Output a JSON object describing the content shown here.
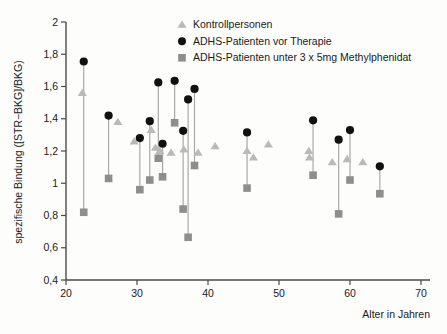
{
  "chart_data": {
    "type": "scatter",
    "title": "",
    "xlabel": "Alter in Jahren",
    "ylabel": "spezifische Bindung ([STR−BKG]/BKG)",
    "xlim": [
      20,
      70
    ],
    "ylim": [
      0.4,
      2.0
    ],
    "xticks": [
      20,
      30,
      40,
      50,
      60,
      70
    ],
    "xticklabels": [
      "20",
      "30",
      "40",
      "50",
      "60",
      "70"
    ],
    "yticks": [
      0.4,
      0.6,
      0.8,
      1.0,
      1.2,
      1.4,
      1.6,
      1.8,
      2.0
    ],
    "yticklabels": [
      "0,4",
      "0,6",
      "0,8",
      "1",
      "1,2",
      "1,4",
      "1,6",
      "1,8",
      "2"
    ],
    "grid": false,
    "legend_position": "top-center",
    "series": [
      {
        "name": "Kontrollpersonen",
        "marker": "triangle",
        "color": "#b9b9b9",
        "points": [
          {
            "x": 22.3,
            "y": 1.56
          },
          {
            "x": 27.3,
            "y": 1.38
          },
          {
            "x": 29.6,
            "y": 1.26
          },
          {
            "x": 32.0,
            "y": 1.33
          },
          {
            "x": 32.6,
            "y": 1.22
          },
          {
            "x": 33.2,
            "y": 1.2
          },
          {
            "x": 34.8,
            "y": 1.19
          },
          {
            "x": 36.6,
            "y": 1.21
          },
          {
            "x": 38.6,
            "y": 1.19
          },
          {
            "x": 41.0,
            "y": 1.23
          },
          {
            "x": 45.5,
            "y": 1.2
          },
          {
            "x": 46.4,
            "y": 1.16
          },
          {
            "x": 48.5,
            "y": 1.24
          },
          {
            "x": 54.2,
            "y": 1.2
          },
          {
            "x": 54.3,
            "y": 1.16
          },
          {
            "x": 57.5,
            "y": 1.13
          },
          {
            "x": 59.6,
            "y": 1.15
          },
          {
            "x": 61.8,
            "y": 1.13
          }
        ]
      },
      {
        "name": "ADHS-Patienten vor Therapie",
        "marker": "circle",
        "color": "#111111",
        "points": [
          {
            "x": 22.5,
            "y": 1.755
          },
          {
            "x": 26.0,
            "y": 1.42
          },
          {
            "x": 30.4,
            "y": 1.28
          },
          {
            "x": 31.8,
            "y": 1.385
          },
          {
            "x": 33.0,
            "y": 1.625
          },
          {
            "x": 33.6,
            "y": 1.245
          },
          {
            "x": 35.3,
            "y": 1.635
          },
          {
            "x": 36.5,
            "y": 1.325
          },
          {
            "x": 37.2,
            "y": 1.52
          },
          {
            "x": 38.1,
            "y": 1.585
          },
          {
            "x": 45.5,
            "y": 1.315
          },
          {
            "x": 54.8,
            "y": 1.39
          },
          {
            "x": 58.4,
            "y": 1.27
          },
          {
            "x": 60.0,
            "y": 1.33
          },
          {
            "x": 64.2,
            "y": 1.105
          }
        ]
      },
      {
        "name": "ADHS-Patienten unter 3 x 5mg Methylphenidat",
        "marker": "square",
        "color": "#8e8e8e",
        "points": [
          {
            "x": 22.5,
            "y": 0.82
          },
          {
            "x": 26.0,
            "y": 1.03
          },
          {
            "x": 30.4,
            "y": 0.96
          },
          {
            "x": 31.8,
            "y": 1.02
          },
          {
            "x": 33.0,
            "y": 1.155
          },
          {
            "x": 33.6,
            "y": 1.04
          },
          {
            "x": 35.3,
            "y": 1.375
          },
          {
            "x": 36.5,
            "y": 0.84
          },
          {
            "x": 37.2,
            "y": 0.665
          },
          {
            "x": 38.1,
            "y": 1.11
          },
          {
            "x": 45.5,
            "y": 0.97
          },
          {
            "x": 54.8,
            "y": 1.05
          },
          {
            "x": 58.4,
            "y": 0.81
          },
          {
            "x": 60.0,
            "y": 1.02
          },
          {
            "x": 64.2,
            "y": 0.935
          }
        ]
      }
    ],
    "pair_connectors": [
      {
        "x": 22.5,
        "y_top": 1.755,
        "y_bottom": 0.82
      },
      {
        "x": 26.0,
        "y_top": 1.42,
        "y_bottom": 1.03
      },
      {
        "x": 30.4,
        "y_top": 1.28,
        "y_bottom": 0.96
      },
      {
        "x": 31.8,
        "y_top": 1.385,
        "y_bottom": 1.02
      },
      {
        "x": 33.0,
        "y_top": 1.625,
        "y_bottom": 1.155
      },
      {
        "x": 33.6,
        "y_top": 1.245,
        "y_bottom": 1.04
      },
      {
        "x": 35.3,
        "y_top": 1.635,
        "y_bottom": 1.375
      },
      {
        "x": 36.5,
        "y_top": 1.325,
        "y_bottom": 0.84
      },
      {
        "x": 37.2,
        "y_top": 1.52,
        "y_bottom": 0.665
      },
      {
        "x": 38.1,
        "y_top": 1.585,
        "y_bottom": 1.11
      },
      {
        "x": 45.5,
        "y_top": 1.315,
        "y_bottom": 0.97
      },
      {
        "x": 54.8,
        "y_top": 1.39,
        "y_bottom": 1.05
      },
      {
        "x": 58.4,
        "y_top": 1.27,
        "y_bottom": 0.81
      },
      {
        "x": 60.0,
        "y_top": 1.33,
        "y_bottom": 1.02
      },
      {
        "x": 64.2,
        "y_top": 1.105,
        "y_bottom": 0.935
      }
    ]
  },
  "legend": {
    "items": [
      {
        "label": "Kontrollpersonen",
        "marker": "triangle-icon",
        "color": "#b9b9b9"
      },
      {
        "label": "ADHS-Patienten vor Therapie",
        "marker": "circle-icon",
        "color": "#111111"
      },
      {
        "label": "ADHS-Patienten unter 3 x 5mg Methylphenidat",
        "marker": "square-icon",
        "color": "#8e8e8e"
      }
    ]
  },
  "axes": {
    "x_title": "Alter in Jahren",
    "y_title": "spezifische Bindung ([STR−BKG]/BKG)"
  },
  "colors": {
    "axis": "#4a4a4a",
    "connector": "#a8a8a8",
    "control": "#b9b9b9",
    "pre_therapy": "#111111",
    "on_medication": "#8e8e8e",
    "background": "#fdfdfc"
  }
}
